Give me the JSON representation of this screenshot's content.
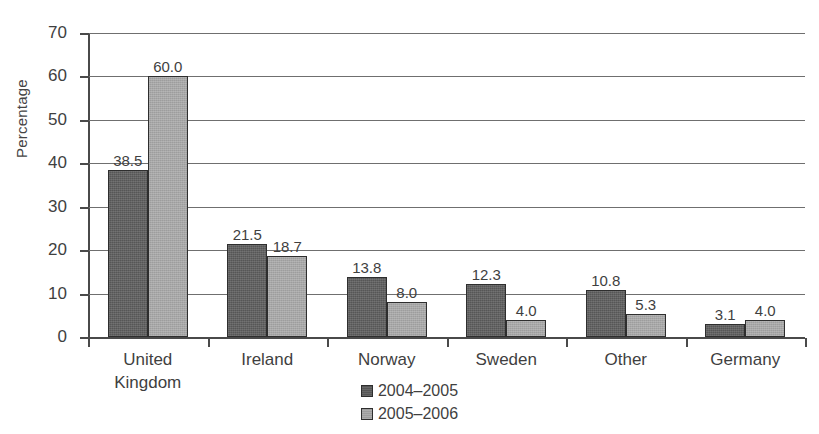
{
  "chart_data": {
    "type": "bar",
    "title": "",
    "subtitle": "",
    "xlabel": "",
    "ylabel": "Percentage",
    "ylim": [
      0,
      70
    ],
    "yticks": [
      0,
      10,
      20,
      30,
      40,
      50,
      60,
      70
    ],
    "ytick_labels": [
      "0",
      "10",
      "20",
      "30",
      "40",
      "50",
      "60",
      "70"
    ],
    "grid": true,
    "legend_position": "bottom-center",
    "categories": [
      "United\nKingdom",
      "Ireland",
      "Norway",
      "Sweden",
      "Other",
      "Germany"
    ],
    "series": [
      {
        "name": "2004–2005",
        "color": "#565656",
        "values": [
          38.5,
          21.5,
          13.8,
          12.3,
          10.8,
          3.1
        ],
        "value_labels": [
          "38.5",
          "21.5",
          "13.8",
          "12.3",
          "10.8",
          "3.1"
        ]
      },
      {
        "name": "2005–2006",
        "color": "#9d9d9d",
        "values": [
          60.0,
          18.7,
          8.0,
          4.0,
          5.3,
          4.0
        ],
        "value_labels": [
          "60.0",
          "18.7",
          "8.0",
          "4.0",
          "5.3",
          "4.0"
        ]
      }
    ]
  },
  "colors": {
    "axis": "#4a4a4a",
    "grid": "#6f6f6f",
    "bar_outline": "#2e2e2e",
    "text": "#3f3f3f",
    "background": "#ffffff"
  }
}
